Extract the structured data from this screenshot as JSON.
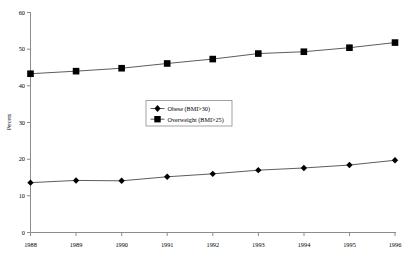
{
  "chart_data": {
    "type": "line",
    "title": "",
    "subtitle": "",
    "xlabel": "",
    "ylabel": "Percent",
    "categories": [
      "1988",
      "1989",
      "1990",
      "1991",
      "1992",
      "1993",
      "1994",
      "1995",
      "1996"
    ],
    "x": [
      1988,
      1989,
      1990,
      1991,
      1992,
      1993,
      1994,
      1995,
      1996
    ],
    "xlim": [
      1988,
      1996
    ],
    "ylim": [
      0,
      60
    ],
    "yticks": [
      0,
      10,
      20,
      30,
      40,
      50,
      60
    ],
    "ytick_labels": [
      "0",
      "10",
      "20",
      "30",
      "40",
      "50",
      "60"
    ],
    "grid": false,
    "legend_position": "center",
    "series": [
      {
        "name": "Obese (BMI>30)",
        "marker": "diamond",
        "values": [
          13.6,
          14.2,
          14.1,
          15.2,
          16.0,
          17.0,
          17.6,
          18.4,
          19.7
        ]
      },
      {
        "name": "Overweight (BMI>25)",
        "marker": "square",
        "values": [
          43.3,
          44.0,
          44.8,
          46.1,
          47.3,
          48.8,
          49.3,
          50.4,
          51.8
        ]
      }
    ],
    "colors": {
      "line": "#4a4a4a",
      "marker": "#000000",
      "axis": "#8c8c8c",
      "background": "#ffffff"
    }
  },
  "axis": {
    "y_title": "Percent",
    "y_labels": [
      "60",
      "50",
      "40",
      "30",
      "20",
      "10",
      "0"
    ],
    "x_labels": [
      "1988",
      "1989",
      "1990",
      "1991",
      "1992",
      "1993",
      "1994",
      "1995",
      "1996"
    ]
  },
  "legend": {
    "entries": [
      {
        "label": "Obese (BMI>30)",
        "marker": "diamond"
      },
      {
        "label": "Overweight (BMI>25)",
        "marker": "square"
      }
    ]
  }
}
